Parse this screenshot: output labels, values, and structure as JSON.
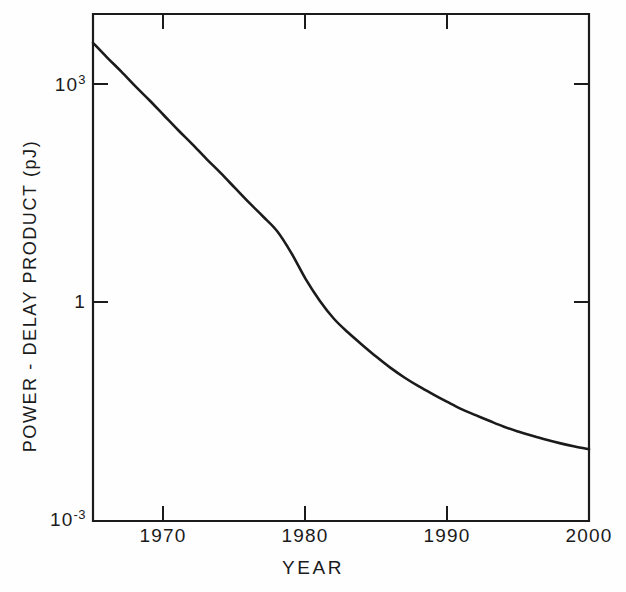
{
  "chart_data": {
    "type": "line",
    "title": "",
    "subtitle": "",
    "xlabel": "YEAR",
    "ylabel": "POWER - DELAY PRODUCT (pJ)",
    "xlim": [
      1965,
      2000
    ],
    "ylim": [
      0.001,
      10000
    ],
    "yscale": "log",
    "xscale": "linear",
    "grid": false,
    "legend": null,
    "xticks": [
      1970,
      1980,
      1990,
      2000
    ],
    "xtick_labels": [
      "1970",
      "1980",
      "1990",
      "2000"
    ],
    "yticks": [
      1000,
      1,
      0.001
    ],
    "ytick_labels": [
      "10 3",
      "1",
      "10 -3"
    ],
    "annotations": [],
    "series": [
      {
        "name": "power-delay product",
        "x": [
          1965,
          1966,
          1967,
          1968,
          1969,
          1970,
          1971,
          1972,
          1973,
          1974,
          1975,
          1976,
          1977,
          1978,
          1979,
          1980,
          1981,
          1982,
          1983,
          1984,
          1985,
          1986,
          1987,
          1988,
          1989,
          1990,
          1991,
          1992,
          1993,
          1994,
          1995,
          1996,
          1997,
          1998,
          1999,
          2000
        ],
        "y": [
          4000,
          2500,
          1600,
          1000,
          640,
          400,
          250,
          160,
          100,
          64,
          40,
          25,
          16,
          10,
          5.0,
          2.2,
          1.1,
          0.62,
          0.4,
          0.27,
          0.185,
          0.13,
          0.095,
          0.072,
          0.056,
          0.044,
          0.035,
          0.029,
          0.024,
          0.02,
          0.0172,
          0.015,
          0.0132,
          0.0118,
          0.0107,
          0.0098
        ]
      }
    ]
  },
  "axes": {
    "y_labels": [
      {
        "base": "10",
        "exp": "3",
        "y_px": 84
      },
      {
        "base": "1",
        "exp": "",
        "y_px": 302
      },
      {
        "base": "10",
        "exp": "-3",
        "y_px": 519
      }
    ],
    "x_labels": [
      {
        "text": "1970",
        "x_px": 163
      },
      {
        "text": "1980",
        "x_px": 305
      },
      {
        "text": "1990",
        "x_px": 447
      },
      {
        "text": "2000",
        "x_px": 589
      }
    ]
  },
  "style": {
    "line_color": "#1b1b1b",
    "axis_color": "#1b1b1b",
    "background": "#fefefe"
  }
}
